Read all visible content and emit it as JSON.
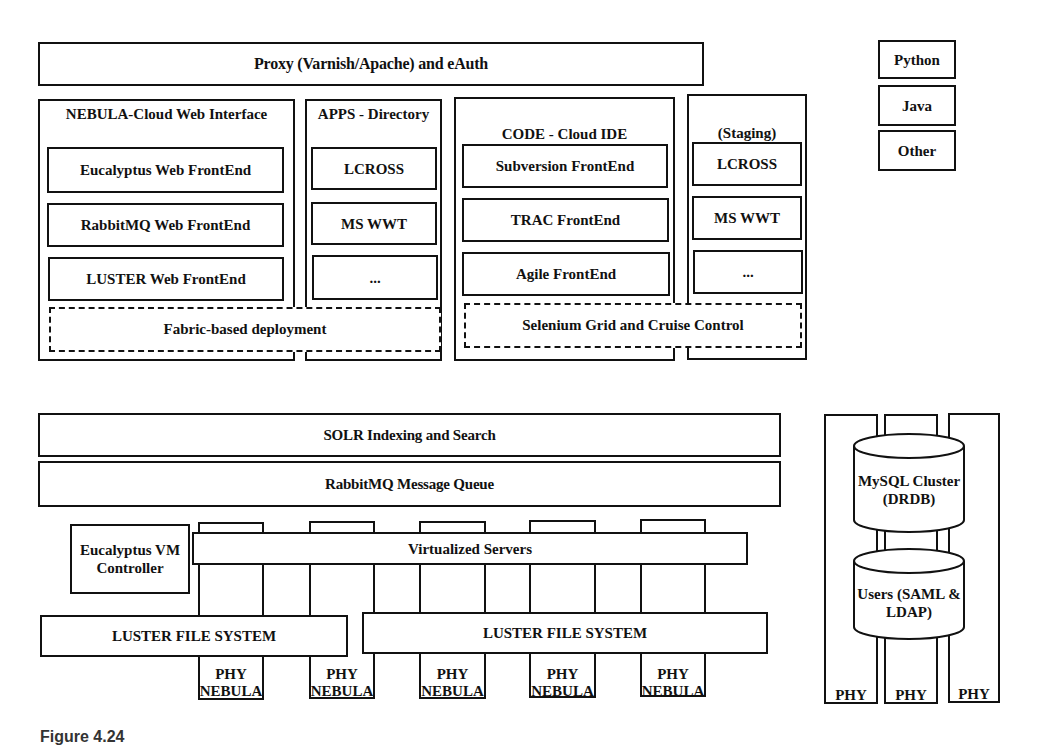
{
  "top": {
    "proxy": "Proxy (Varnish/Apache) and eAuth",
    "languages": [
      "Python",
      "Java",
      "Other"
    ]
  },
  "nebula_web": {
    "title": "NEBULA-Cloud Web Interface",
    "items": [
      "Eucalyptus Web FrontEnd",
      "RabbitMQ Web FrontEnd",
      "LUSTER Web FrontEnd"
    ]
  },
  "apps": {
    "title": "APPS - Directory",
    "items": [
      "LCROSS",
      "MS WWT",
      "..."
    ]
  },
  "fabric": "Fabric-based deployment",
  "code_ide": {
    "title": "CODE - Cloud IDE",
    "items": [
      "Subversion FrontEnd",
      "TRAC FrontEnd",
      "Agile FrontEnd"
    ]
  },
  "staging": {
    "title": "(Staging)",
    "items": [
      "LCROSS",
      "MS WWT",
      "..."
    ]
  },
  "selenium": "Selenium Grid and Cruise Control",
  "bottom": {
    "solr": "SOLR Indexing and Search",
    "rabbitmq": "RabbitMQ Message Queue",
    "vm_controller": "Eucalyptus VM Controller",
    "virtualized": "Virtualized Servers",
    "luster_left": "LUSTER FILE SYSTEM",
    "luster_right": "LUSTER FILE SYSTEM",
    "phy_nebula": [
      "PHY NEBULA",
      "PHY NEBULA",
      "PHY NEBULA",
      "PHY NEBULA",
      "PHY NEBULA"
    ]
  },
  "db": {
    "mysql": "MySQL Cluster (DRDB)",
    "users": "Users (SAML & LDAP)",
    "phy": [
      "PHY",
      "PHY",
      "PHY"
    ]
  },
  "caption": "Figure 4.24"
}
